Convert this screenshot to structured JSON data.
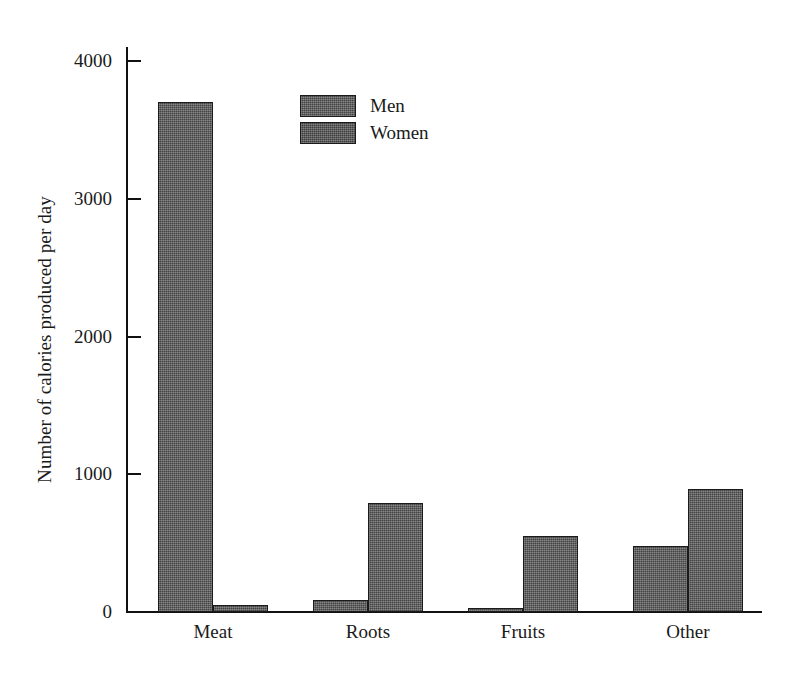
{
  "chart_data": {
    "type": "bar",
    "title": "",
    "xlabel": "",
    "ylabel": "Number of calories produced per day",
    "categories": [
      "Meat",
      "Roots",
      "Fruits",
      "Other"
    ],
    "series": [
      {
        "name": "Men",
        "values": [
          3700,
          90,
          30,
          480
        ]
      },
      {
        "name": "Women",
        "values": [
          50,
          790,
          550,
          890
        ]
      }
    ],
    "ylim": [
      0,
      4000
    ],
    "yticks": [
      0,
      1000,
      2000,
      3000,
      4000
    ],
    "ytick_labels": [
      "0",
      "1000",
      "2000",
      "3000",
      "4000"
    ],
    "grid": false,
    "legend_position": "upper center",
    "legend_entries": [
      "Men",
      "Women"
    ],
    "bar_fill_color": "#575757",
    "bar_edge_color": "#1b1b1b",
    "background_color": "#ffffff",
    "text_color": "#1a1a1a"
  }
}
